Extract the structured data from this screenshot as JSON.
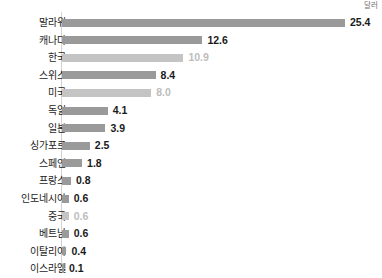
{
  "unit_caption": "달러",
  "chart_data": {
    "type": "bar",
    "orientation": "horizontal",
    "title": "",
    "subtitle": "",
    "xlabel": "",
    "ylabel": "",
    "unit": "달러",
    "grid": false,
    "legend": "none",
    "axis_line": true,
    "xlim": [
      0,
      25.4
    ],
    "categories": [
      "말라위",
      "캐나다",
      "한국",
      "스위스",
      "미국",
      "독일",
      "일본",
      "싱가포르",
      "스페인",
      "프랑스",
      "인도네시아",
      "중국",
      "베트남",
      "이탈리아",
      "이스라엘",
      "인도"
    ],
    "values": [
      25.4,
      12.6,
      10.9,
      8.4,
      8.0,
      4.1,
      3.9,
      2.5,
      1.8,
      0.8,
      0.6,
      0.6,
      0.6,
      0.4,
      0.1,
      0.09
    ],
    "value_labels": [
      "25.4",
      "12.6",
      "10.9",
      "8.4",
      "8.0",
      "4.1",
      "3.9",
      "2.5",
      "1.8",
      "0.8",
      "0.6",
      "0.6",
      "0.6",
      "0.4",
      "0.1",
      "0.09"
    ],
    "highlight_style": [
      "normal",
      "normal",
      "muted",
      "normal",
      "muted",
      "normal",
      "normal",
      "normal",
      "normal",
      "normal",
      "normal",
      "muted",
      "normal",
      "normal",
      "normal",
      "plain"
    ],
    "colors": {
      "bar_normal": "#9a9a9a",
      "bar_muted": "#c4c4c4",
      "label_normal": "#1a1a1a",
      "label_muted": "#bdbdbd",
      "axis": "#d2d2d2",
      "background": "#ffffff"
    }
  }
}
